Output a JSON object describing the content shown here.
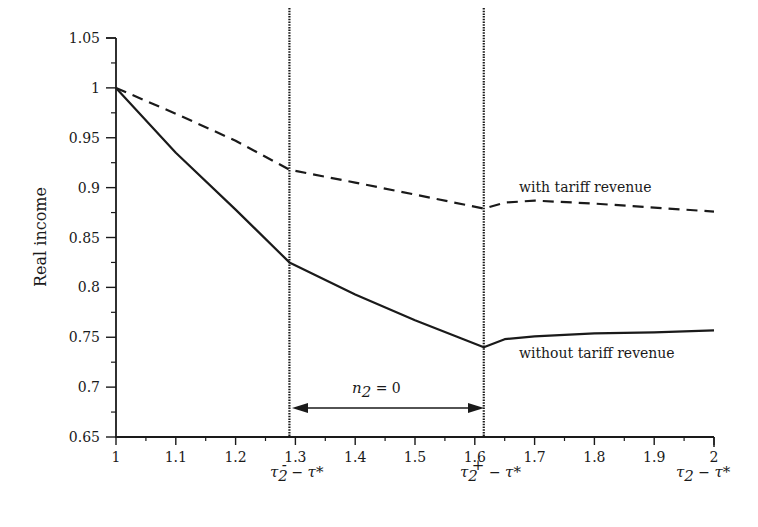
{
  "chart_data": {
    "type": "line",
    "title": "",
    "xlabel": "",
    "ylabel": "Real income",
    "xlim": [
      1,
      2
    ],
    "ylim": [
      0.65,
      1.05
    ],
    "grid": false,
    "x_ticks": [
      "1",
      "1.1",
      "1.2",
      "1.3",
      "1.4",
      "1.5",
      "1.6",
      "1.7",
      "1.8",
      "1.9",
      "2"
    ],
    "y_ticks": [
      "1.05",
      "1",
      "0.95",
      "0.9",
      "0.85",
      "0.8",
      "0.75",
      "0.7",
      "0.65"
    ],
    "series": [
      {
        "name": "with tariff revenue",
        "style": "dashed",
        "x": [
          1.0,
          1.1,
          1.2,
          1.29,
          1.4,
          1.5,
          1.615,
          1.65,
          1.7,
          1.8,
          1.9,
          2.0
        ],
        "values": [
          1.0,
          0.974,
          0.947,
          0.918,
          0.905,
          0.893,
          0.879,
          0.885,
          0.887,
          0.884,
          0.88,
          0.876
        ]
      },
      {
        "name": "without tariff revenue",
        "style": "solid",
        "x": [
          1.0,
          1.1,
          1.2,
          1.29,
          1.4,
          1.5,
          1.615,
          1.65,
          1.7,
          1.8,
          1.9,
          2.0
        ],
        "values": [
          1.0,
          0.935,
          0.878,
          0.825,
          0.793,
          0.767,
          0.74,
          0.748,
          0.751,
          0.754,
          0.755,
          0.757
        ]
      }
    ],
    "vertical_lines": [
      {
        "x": 1.29,
        "style": "dotted",
        "label": "τ2− − τ*"
      },
      {
        "x": 1.615,
        "style": "dotted",
        "label": "τ2+ − τ*"
      }
    ],
    "annotations": [
      {
        "text": "with tariff revenue",
        "x": 1.68,
        "y": 0.892
      },
      {
        "text": "without tariff revenue",
        "x": 1.68,
        "y": 0.727
      },
      {
        "text": "n2 = 0",
        "x": 1.45,
        "y": 0.695,
        "arrow": {
          "from": 1.29,
          "to": 1.615,
          "y": 0.68
        }
      }
    ]
  },
  "labels": {
    "ylabel": "Real income",
    "series_with": "with tariff revenue",
    "series_without": "without tariff revenue",
    "region_var": "n",
    "region_sub": "2",
    "region_eq": " = 0",
    "tau": "τ",
    "sub2": "2",
    "minus_sup": "-",
    "plus_sup": "+",
    "dash": " − ",
    "tau_star": "τ*"
  },
  "colors": {
    "ink": "#1a1a1a",
    "background": "#ffffff"
  }
}
